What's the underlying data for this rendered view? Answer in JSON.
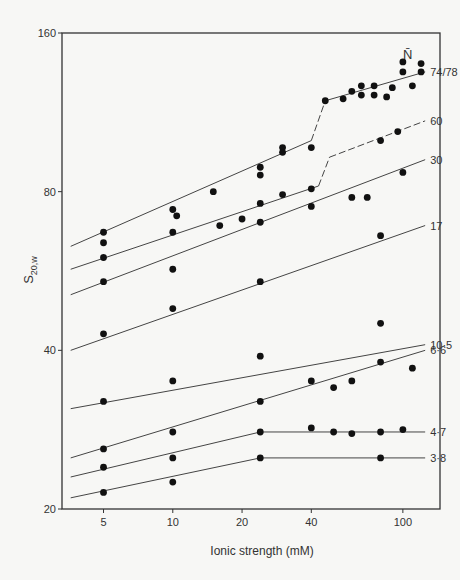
{
  "chart_data": {
    "type": "scatter",
    "title": "",
    "xlabel": "Ionic strength (mM)",
    "ylabel": "S20,w",
    "ylabel_main": "S",
    "ylabel_sub": "20,w",
    "xscale": "log",
    "yscale": "log",
    "xlim": [
      3.3,
      145
    ],
    "ylim": [
      20,
      160
    ],
    "x_ticks": [
      5,
      10,
      20,
      40,
      100
    ],
    "y_ticks": [
      20,
      40,
      80,
      160
    ],
    "grid": false,
    "legend_title": "N̄",
    "series": [
      {
        "name": "74/78",
        "label": "74/78",
        "line": [
          [
            3.6,
            63
          ],
          [
            40,
            100
          ],
          [
            46,
            119
          ],
          [
            125,
            135
          ]
        ],
        "dashed_segment": [
          40,
          46
        ],
        "points": [
          [
            5,
            67
          ],
          [
            5,
            64
          ],
          [
            10,
            74
          ],
          [
            10.4,
            72
          ],
          [
            15,
            80
          ],
          [
            24,
            89
          ],
          [
            24,
            86
          ],
          [
            30,
            97
          ],
          [
            30,
            95
          ],
          [
            40,
            97
          ],
          [
            46,
            119
          ],
          [
            55,
            120
          ],
          [
            60,
            124
          ],
          [
            66,
            122
          ],
          [
            66,
            127
          ],
          [
            75,
            122
          ],
          [
            75,
            127
          ],
          [
            85,
            121
          ],
          [
            90,
            126
          ],
          [
            100,
            141
          ],
          [
            100,
            135
          ],
          [
            110,
            127
          ],
          [
            120,
            140
          ],
          [
            120,
            135
          ]
        ]
      },
      {
        "name": "60",
        "label": "60",
        "line": [
          [
            3.6,
            57
          ],
          [
            43,
            82
          ],
          [
            48,
            93
          ],
          [
            125,
            109
          ]
        ],
        "dashed_segment": [
          43,
          125
        ],
        "points": [
          [
            5,
            60
          ],
          [
            10,
            67
          ],
          [
            16,
            69
          ],
          [
            20,
            71
          ],
          [
            24,
            76
          ],
          [
            30,
            79
          ],
          [
            40,
            81
          ],
          [
            80,
            100
          ],
          [
            95,
            104
          ]
        ]
      },
      {
        "name": "30",
        "label": "30",
        "line": [
          [
            3.6,
            51
          ],
          [
            125,
            92
          ]
        ],
        "points": [
          [
            5,
            54
          ],
          [
            10,
            57
          ],
          [
            24,
            70
          ],
          [
            40,
            75
          ],
          [
            60,
            78
          ],
          [
            70,
            78
          ],
          [
            100,
            87
          ]
        ]
      },
      {
        "name": "17",
        "label": "17",
        "line": [
          [
            3.6,
            40
          ],
          [
            125,
            69
          ]
        ],
        "points": [
          [
            5,
            43
          ],
          [
            10,
            48
          ],
          [
            24,
            54
          ],
          [
            80,
            66
          ]
        ]
      },
      {
        "name": "10.5",
        "label": "10·5",
        "line": [
          [
            3.6,
            31
          ],
          [
            125,
            41
          ]
        ],
        "points": [
          [
            5,
            32
          ],
          [
            10,
            35
          ],
          [
            24,
            39
          ],
          [
            80,
            45
          ]
        ]
      },
      {
        "name": "6.6",
        "label": "6·6",
        "line": [
          [
            3.6,
            25
          ],
          [
            125,
            40
          ]
        ],
        "points": [
          [
            5,
            26
          ],
          [
            10,
            28
          ],
          [
            24,
            32
          ],
          [
            40,
            35
          ],
          [
            50,
            34
          ],
          [
            60,
            35
          ],
          [
            80,
            38
          ],
          [
            110,
            37
          ]
        ]
      },
      {
        "name": "4.7",
        "label": "4·7",
        "line": [
          [
            3.6,
            23
          ],
          [
            24,
            28
          ],
          [
            125,
            28
          ]
        ],
        "points": [
          [
            5,
            24
          ],
          [
            10,
            25
          ],
          [
            24,
            28
          ],
          [
            40,
            28.5
          ],
          [
            50,
            28
          ],
          [
            60,
            27.8
          ],
          [
            80,
            28
          ],
          [
            100,
            28.3
          ]
        ]
      },
      {
        "name": "3.8",
        "label": "3·8",
        "line": [
          [
            3.6,
            21
          ],
          [
            24,
            25
          ],
          [
            125,
            25
          ]
        ],
        "points": [
          [
            5,
            21.5
          ],
          [
            10,
            22.5
          ],
          [
            24,
            25
          ],
          [
            80,
            25
          ]
        ]
      }
    ]
  }
}
